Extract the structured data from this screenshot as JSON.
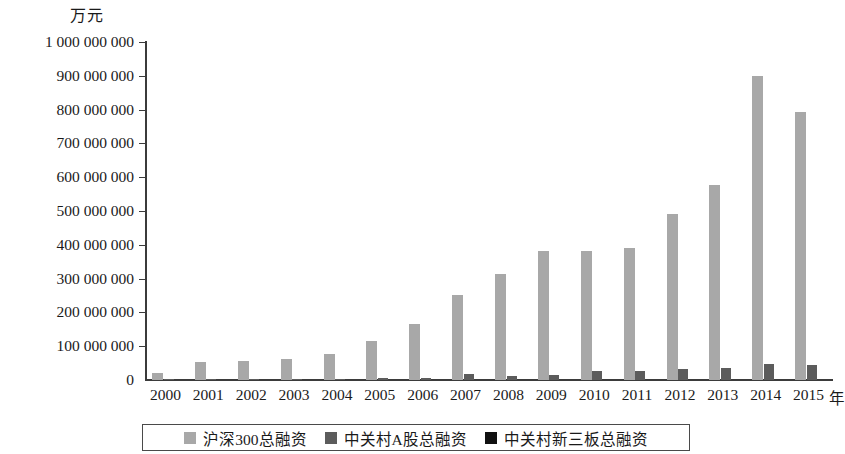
{
  "chart_data": {
    "type": "bar",
    "title": "",
    "subtitle": "",
    "unit_label": "万元",
    "xlabel": "年",
    "ylabel": "",
    "ylim": [
      0,
      1000000000
    ],
    "ytick_step": 100000000,
    "grid": false,
    "legend_position": "bottom",
    "categories": [
      "2000",
      "2001",
      "2002",
      "2003",
      "2004",
      "2005",
      "2006",
      "2007",
      "2008",
      "2009",
      "2010",
      "2011",
      "2012",
      "2013",
      "2014",
      "2015"
    ],
    "ytick_labels": [
      "1 000 000 000",
      "900 000 000",
      "800 000 000",
      "700 000 000",
      "600 000 000",
      "500 000 000",
      "400 000 000",
      "300 000 000",
      "200 000 000",
      "100 000 000",
      "0"
    ],
    "ytick_values": [
      1000000000,
      900000000,
      800000000,
      700000000,
      600000000,
      500000000,
      400000000,
      300000000,
      200000000,
      100000000,
      0
    ],
    "series": [
      {
        "name": "沪深300总融资",
        "color": "#a8a8a8",
        "values": [
          20000000,
          53000000,
          56000000,
          62000000,
          76000000,
          115000000,
          165000000,
          252000000,
          315000000,
          383000000,
          383000000,
          390000000,
          492000000,
          577000000,
          900000000,
          793000000
        ]
      },
      {
        "name": "中关村A股总融资",
        "color": "#5c5c5c",
        "values": [
          2000000,
          3000000,
          3000000,
          3000000,
          4000000,
          7000000,
          5000000,
          19000000,
          11000000,
          16000000,
          28000000,
          27000000,
          32000000,
          35000000,
          47000000,
          44000000
        ]
      },
      {
        "name": "中关村新三板总融资",
        "color": "#111111",
        "values": [
          0,
          0,
          0,
          0,
          0,
          0,
          0,
          0,
          0,
          0,
          0,
          0,
          0,
          0,
          0,
          0
        ]
      }
    ]
  }
}
